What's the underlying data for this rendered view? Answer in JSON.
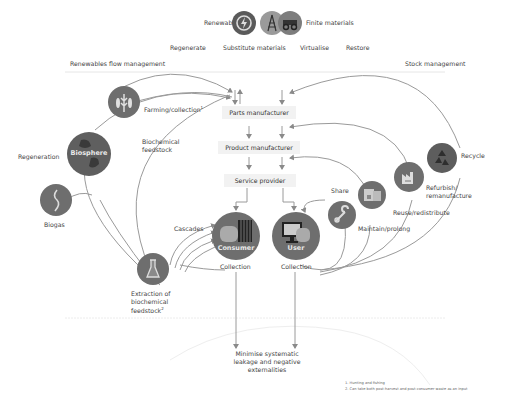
{
  "header": {
    "renewables_label": "Renewables",
    "finite_label": "Finite materials",
    "strategies": [
      "Regenerate",
      "Substitute materials",
      "Virtualise",
      "Restore"
    ]
  },
  "sections": {
    "left": "Renewables flow management",
    "right": "Stock management"
  },
  "center_chain": {
    "parts_manufacturer": "Parts manufacturer",
    "product_manufacturer": "Product manufacturer",
    "service_provider": "Service provider"
  },
  "left_nodes": {
    "farming": "Farming/collection",
    "farming_sup": "1",
    "biochemical_feedstock": "Biochemical\nfeedstock",
    "regeneration": "Regeneration",
    "biosphere": "Biosphere",
    "biogas": "Biogas",
    "cascades": "Cascades",
    "extraction": "Extraction of\nbiochemical\nfeedstock",
    "extraction_sup": "2"
  },
  "center_nodes": {
    "consumer": "Consumer",
    "consumer_collection": "Collection",
    "user": "User",
    "user_collection": "Collection"
  },
  "right_nodes": {
    "recycle": "Recycle",
    "refurbish": "Refurbish/\nremanufacture",
    "reuse": "Reuse/redistribute",
    "maintain": "Maintain/prolong",
    "share": "Share"
  },
  "bottom": {
    "leakage": "Minimise systematic\nleakage and negative\nexternalities"
  },
  "footnotes": [
    "1. Hunting and fishing",
    "2. Can take both post-harvest and post-consumer waste as an input"
  ],
  "colors": {
    "circle": "#6e6e6e",
    "circle_dark": "#4a4a4a",
    "line": "#8a8a8a",
    "box": "#f2f2f2",
    "text": "#444444"
  },
  "icons": {
    "renewables": "renewable-energy-icon",
    "finite_1": "oil-rig-icon",
    "finite_2": "mining-truck-icon",
    "farming": "wheat-fish-icon",
    "biosphere": "globe-icon",
    "biogas": "biogas-icon",
    "extraction": "flask-icon",
    "consumer": "consumer-goods-icon",
    "user": "monitor-icon",
    "share": "wrench-icon",
    "maintain": "boxes-icon",
    "reuse": "factory-icon",
    "recycle": "recycle-icon"
  }
}
